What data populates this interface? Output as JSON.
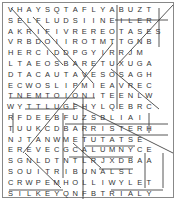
{
  "puzzle": {
    "type": "word-search",
    "rows": [
      [
        "V",
        "H",
        "A",
        "Y",
        "S",
        "Q",
        "T",
        "A",
        "F",
        "L",
        "Y",
        "A",
        "B",
        "U",
        "Z",
        "T",
        "",
        ""
      ],
      [
        "S",
        "E",
        "L",
        "F",
        "L",
        "U",
        "D",
        "S",
        "I",
        "I",
        "N",
        "E",
        "I",
        "L",
        "E",
        "R",
        "",
        ""
      ],
      [
        "A",
        "K",
        "R",
        "I",
        "F",
        "I",
        "V",
        "R",
        "E",
        "R",
        "E",
        "O",
        "T",
        "A",
        "S",
        "E",
        "S",
        ""
      ],
      [
        "V",
        "R",
        "B",
        "D",
        "O",
        "I",
        "I",
        "R",
        "O",
        "T",
        "M",
        "T",
        "T",
        "G",
        "N",
        "B",
        "",
        ""
      ],
      [
        "H",
        "E",
        "R",
        "C",
        "I",
        "D",
        "D",
        "P",
        "G",
        "Y",
        "I",
        "R",
        "R",
        "J",
        "M",
        "",
        "",
        ""
      ],
      [
        "L",
        "T",
        "A",
        "E",
        "O",
        "S",
        "B",
        "A",
        "R",
        "E",
        "T",
        "U",
        "X",
        "U",
        "G",
        "A",
        "",
        ""
      ],
      [
        "D",
        "T",
        "A",
        "C",
        "A",
        "U",
        "T",
        "A",
        "V",
        "E",
        "S",
        "O",
        "S",
        "A",
        "G",
        "H",
        "",
        ""
      ],
      [
        "E",
        "C",
        "W",
        "O",
        "S",
        "L",
        "I",
        "P",
        "M",
        "I",
        "E",
        "A",
        "V",
        "R",
        "E",
        "C",
        "",
        ""
      ],
      [
        "T",
        "N",
        "E",
        "M",
        "T",
        "O",
        "I",
        "O",
        "N",
        "I",
        "T",
        "E",
        "E",
        "N",
        "L",
        "W",
        "",
        ""
      ],
      [
        "W",
        "Y",
        "T",
        "T",
        "L",
        "U",
        "G",
        "E",
        "H",
        "Y",
        "L",
        "Q",
        "E",
        "B",
        "R",
        "C",
        "",
        ""
      ],
      [
        "R",
        "F",
        "D",
        "E",
        "E",
        "B",
        "F",
        "U",
        "Z",
        "S",
        "B",
        "L",
        "I",
        "A",
        "I",
        "",
        "",
        ""
      ],
      [
        "T",
        "U",
        "U",
        "K",
        "C",
        "D",
        "B",
        "A",
        "R",
        "R",
        "I",
        "S",
        "T",
        "E",
        "R",
        "H",
        "",
        ""
      ],
      [
        "N",
        "J",
        "T",
        "A",
        "N",
        "W",
        "M",
        "E",
        "T",
        "U",
        "T",
        "A",
        "T",
        "S",
        "E",
        "",
        "",
        ""
      ],
      [
        "E",
        "R",
        "E",
        "V",
        "E",
        "C",
        "G",
        "C",
        "A",
        "L",
        "U",
        "M",
        "N",
        "Y",
        "C",
        "E",
        "",
        ""
      ],
      [
        "S",
        "G",
        "N",
        "L",
        "D",
        "T",
        "N",
        "T",
        "L",
        "R",
        "J",
        "X",
        "D",
        "B",
        "A",
        "A",
        "",
        ""
      ],
      [
        "S",
        "O",
        "U",
        "I",
        "T",
        "R",
        "I",
        "B",
        "U",
        "N",
        "A",
        "L",
        "S",
        "L",
        "",
        "",
        "",
        ""
      ],
      [
        "C",
        "R",
        "W",
        "P",
        "E",
        "M",
        "H",
        "O",
        "L",
        "L",
        "I",
        "W",
        "Y",
        "L",
        "E",
        "T",
        "",
        ""
      ],
      [
        "S",
        "I",
        "L",
        "K",
        "E",
        "Y",
        "Q",
        "N",
        "F",
        "B",
        "T",
        "R",
        "I",
        "A",
        "L",
        "Y",
        "",
        ""
      ]
    ],
    "line_color": "#444444",
    "text_color": "#333333",
    "border_color": "#888888"
  }
}
